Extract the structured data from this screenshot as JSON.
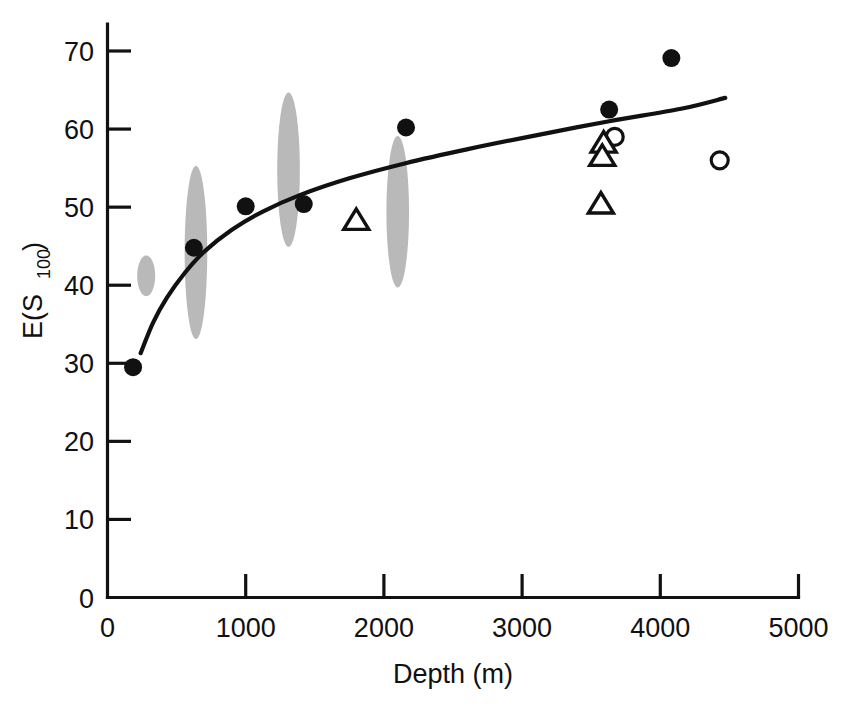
{
  "chart_data": {
    "type": "scatter",
    "title": "",
    "subtitle": "",
    "xlabel": "Depth (m)",
    "ylabel": "E(S",
    "ylabel_sub": "100",
    "ylabel_tail": ")",
    "ylabel_full": "E(S100)",
    "xlim": [
      0,
      5000
    ],
    "ylim": [
      0,
      70
    ],
    "x_ticks": [
      0,
      1000,
      2000,
      3000,
      4000,
      5000
    ],
    "x_tick_labels": [
      "0",
      "1000",
      "2000",
      "3000",
      "4000",
      "5000"
    ],
    "y_ticks": [
      0,
      10,
      20,
      30,
      40,
      50,
      60,
      70
    ],
    "y_tick_labels": [
      "0",
      "10",
      "20",
      "30",
      "40",
      "50",
      "60",
      "70"
    ],
    "grid": false,
    "legend": "none",
    "series": [
      {
        "name": "filled-circles",
        "marker": "filled circle",
        "color": "#111111",
        "points": [
          {
            "x": 185,
            "y": 29.5
          },
          {
            "x": 625,
            "y": 44.8
          },
          {
            "x": 1000,
            "y": 50.1
          },
          {
            "x": 1420,
            "y": 50.4
          },
          {
            "x": 2160,
            "y": 60.2
          },
          {
            "x": 3630,
            "y": 62.5
          },
          {
            "x": 4080,
            "y": 69.1
          }
        ]
      },
      {
        "name": "open-circles",
        "marker": "open circle",
        "color": "#111111",
        "points": [
          {
            "x": 3670,
            "y": 59.0
          },
          {
            "x": 4430,
            "y": 56.0
          }
        ]
      },
      {
        "name": "open-triangles",
        "marker": "open triangle",
        "color": "#111111",
        "points": [
          {
            "x": 1800,
            "y": 48.3
          },
          {
            "x": 3590,
            "y": 58.2
          },
          {
            "x": 3580,
            "y": 56.5
          },
          {
            "x": 3570,
            "y": 50.4
          }
        ]
      }
    ],
    "fit_curve": {
      "name": "logarithmic fit",
      "color": "#111111",
      "points": [
        {
          "x": 240,
          "y": 31.3
        },
        {
          "x": 330,
          "y": 35.2
        },
        {
          "x": 430,
          "y": 38.4
        },
        {
          "x": 560,
          "y": 41.6
        },
        {
          "x": 700,
          "y": 44.3
        },
        {
          "x": 900,
          "y": 47.1
        },
        {
          "x": 1120,
          "y": 49.4
        },
        {
          "x": 1400,
          "y": 51.6
        },
        {
          "x": 1750,
          "y": 53.7
        },
        {
          "x": 2150,
          "y": 55.6
        },
        {
          "x": 2600,
          "y": 57.4
        },
        {
          "x": 3100,
          "y": 59.2
        },
        {
          "x": 3630,
          "y": 61.0
        },
        {
          "x": 4150,
          "y": 62.6
        },
        {
          "x": 4470,
          "y": 64.0
        }
      ]
    },
    "ellipses": [
      {
        "name": "band-1",
        "cx": 280,
        "cy": 41.2,
        "rx_m": 65,
        "ry": 2.6,
        "color": "#b9b9b9"
      },
      {
        "name": "band-2",
        "cx": 640,
        "cy": 44.2,
        "rx_m": 82,
        "ry": 11.1,
        "color": "#b9b9b9"
      },
      {
        "name": "band-3",
        "cx": 1310,
        "cy": 54.8,
        "rx_m": 82,
        "ry": 9.9,
        "color": "#b9b9b9"
      },
      {
        "name": "band-4",
        "cx": 2100,
        "cy": 49.4,
        "rx_m": 82,
        "ry": 9.7,
        "color": "#b9b9b9"
      }
    ]
  },
  "colors": {
    "axis": "#111111",
    "marker_fill": "#111111",
    "marker_open": "#ffffff",
    "band": "#b9b9b9",
    "background": "#ffffff"
  }
}
